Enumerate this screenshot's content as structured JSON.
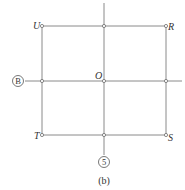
{
  "diagram": {
    "type": "grid-with-labeled-points",
    "caption": "(b)",
    "axis_markers": {
      "horizontal": "B",
      "vertical": "5"
    },
    "points": {
      "U": "U",
      "R": "R",
      "O": "O",
      "T": "T",
      "S": "S"
    },
    "colors": {
      "line": "#8a8a8a",
      "text": "#333333",
      "background": "#ffffff"
    }
  }
}
